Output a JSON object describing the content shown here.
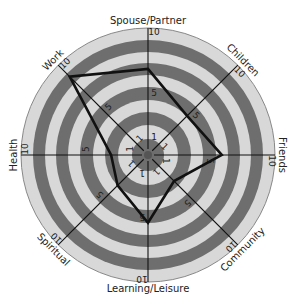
{
  "chart_data": {
    "type": "radar",
    "title": "",
    "axes": [
      "Spouse/Partner",
      "Children",
      "Friends",
      "Community",
      "Learning/Leisure",
      "Spiritual",
      "Health",
      "Work"
    ],
    "values": [
      7,
      4.5,
      6,
      3,
      5.5,
      3.5,
      3,
      9
    ],
    "range": [
      0,
      10
    ],
    "tick_labels": [
      "1",
      "5",
      "10"
    ],
    "rings": 10,
    "grid": true,
    "legend": "none"
  },
  "colors": {
    "dark_band": "#6e6e6e",
    "light_band": "#d8d8d8",
    "line": "#111111"
  }
}
